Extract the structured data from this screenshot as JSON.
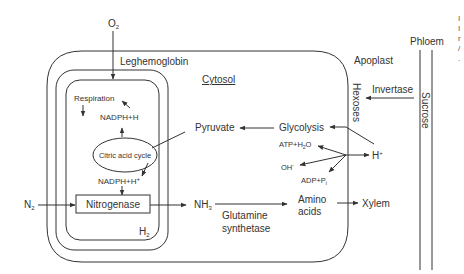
{
  "labels": {
    "o2": "O",
    "o2_sub": "2",
    "leghemoglobin": "Leghemoglobin",
    "cytosol": "Cytosol",
    "apoplast": "Apoplast",
    "phloem": "Phloem",
    "invertase": "Invertase",
    "hexoses": "Hexoses",
    "sucrose": "Sucrose",
    "respiration": "Respiration",
    "nadph_top": "NADPH+H",
    "citric_acid_cycle": "Citric acid cycle",
    "nadph_bottom": "NADPH+H",
    "nadph_bottom_sup": "+",
    "pyruvate": "Pyruvate",
    "glycolysis": "Glycolysis",
    "atp_h2o": "ATP+H",
    "atp_h2o_sub": "2",
    "atp_h2o_end": "O",
    "oh": "OH",
    "oh_sup": "-",
    "adp_pi": "ADP+P",
    "adp_pi_sub": "i",
    "h_plus": "H",
    "h_plus_sup": "+",
    "n2": "N",
    "n2_sub": "2",
    "nitrogenase": "Nitrogenase",
    "nh3": "NH",
    "nh3_sub": "3",
    "glutamine": "Glutamine",
    "synthetase": "synthetase",
    "amino": "Amino",
    "acids": "acids",
    "xylem": "Xylem",
    "h2": "H",
    "h2_sub": "2"
  },
  "edge_fragments": [
    "I",
    "I",
    "r",
    "/",
    "."
  ],
  "colors": {
    "line": "#333333",
    "text": "#333333",
    "background": "#ffffff"
  }
}
